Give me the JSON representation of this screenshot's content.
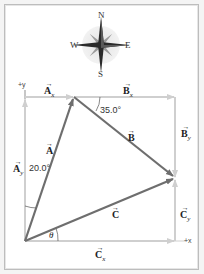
{
  "compass": {
    "north": "N",
    "south": "S",
    "east": "E",
    "west": "W"
  },
  "axes": {
    "y_label": "+y",
    "x_label": "+x"
  },
  "vectors": {
    "A": {
      "label": "A",
      "component_x": "A",
      "component_x_sub": "x",
      "component_y": "A",
      "component_y_sub": "y",
      "angle": "20.0°"
    },
    "B": {
      "label": "B",
      "component_x": "B",
      "component_x_sub": "x",
      "component_y": "B",
      "component_y_sub": "y",
      "angle": "35.0°"
    },
    "C": {
      "label": "C",
      "component_x": "C",
      "component_x_sub": "x",
      "component_y": "C",
      "component_y_sub": "y",
      "angle": "θ"
    }
  },
  "colors": {
    "resultant": "#6e6e6e",
    "component": "#c8c8c8",
    "frame": "#bdbdbd"
  }
}
